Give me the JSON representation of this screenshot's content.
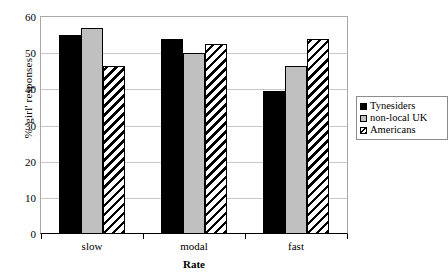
{
  "chart_data": {
    "type": "bar",
    "title": "",
    "xlabel": "Rate",
    "ylabel": "% 'girl' responses",
    "categories": [
      "slow",
      "modal",
      "fast"
    ],
    "series": [
      {
        "name": "Tynesiders",
        "values": [
          55,
          54,
          39.5
        ],
        "swatch": "solid-black"
      },
      {
        "name": "non-local UK",
        "values": [
          57,
          50,
          46.5
        ],
        "swatch": "solid-gray"
      },
      {
        "name": "Americans",
        "values": [
          46.5,
          52.5,
          54
        ],
        "swatch": "diagonal-hatch"
      }
    ],
    "ylim": [
      0,
      60
    ],
    "yticks": [
      0,
      10,
      20,
      30,
      40,
      50,
      60
    ],
    "ytick_labels": [
      "0",
      "10",
      "20",
      "30",
      "40",
      "50",
      "60"
    ],
    "grid": true,
    "grid_axis": "y",
    "legend_position": "right",
    "colors": {
      "series_1": "#000000",
      "series_2": "#C0C0C0",
      "series_3": "#FFFFFF",
      "hatch": "#000000",
      "gridline": "#C8C8C8",
      "axis": "#000000",
      "frame": "#A9A9A9",
      "background": "#FFFFFF"
    }
  }
}
